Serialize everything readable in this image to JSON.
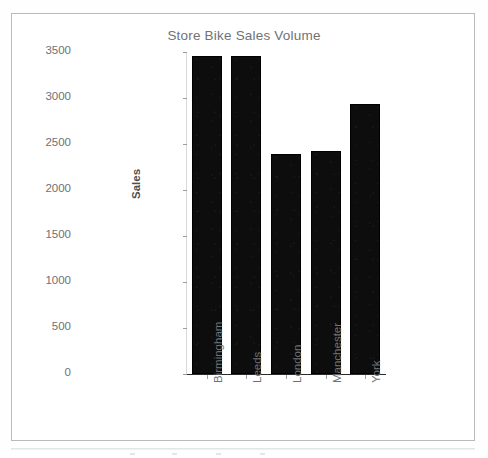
{
  "chart_data": {
    "type": "bar",
    "title": "Store Bike Sales Volume",
    "xlabel": "",
    "ylabel": "Sales",
    "categories": [
      "Birmingham",
      "Leeds",
      "London",
      "Manchester",
      "York"
    ],
    "values": [
      3460,
      3455,
      2390,
      2425,
      2935
    ],
    "series": [
      {
        "name": "Sales",
        "values": [
          3460,
          3455,
          2390,
          2425,
          2935
        ]
      }
    ],
    "ylim": [
      0,
      3500
    ],
    "y_ticks": [
      0,
      500,
      1000,
      1500,
      2000,
      2500,
      3000,
      3500
    ],
    "y_tick_labels": [
      "0",
      "500",
      "1000",
      "1500",
      "2000",
      "2500",
      "3000",
      "3500"
    ],
    "grid": false,
    "legend": "none",
    "bar_color": "#0d0d0d",
    "title_color": "#6f7276",
    "tick_color": "#6e7175",
    "axis_color": "#2a2a2a",
    "frame_color": "#b9bcbe",
    "x_tick_label_rotation": -90
  },
  "figure": {
    "title": "Store Bike Sales Volume",
    "y_axis_title": "Sales"
  }
}
